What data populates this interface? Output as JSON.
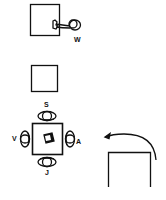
{
  "diagram": {
    "panels": [
      {
        "id": "panel-1",
        "description": "person W reaching toward square",
        "labels": [
          "W"
        ]
      },
      {
        "id": "panel-2",
        "description": "empty square"
      },
      {
        "id": "panel-3",
        "description": "four persons seated around table with object",
        "labels": [
          "S",
          "V",
          "A",
          "J"
        ]
      },
      {
        "id": "panel-4",
        "description": "open box with curved arrow"
      }
    ],
    "labels": {
      "w": "W",
      "s": "S",
      "v": "V",
      "a": "A",
      "j": "J"
    },
    "colors": {
      "stroke": "#111111",
      "background": "#ffffff"
    }
  }
}
